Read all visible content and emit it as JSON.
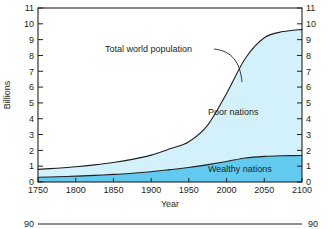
{
  "chart_data": {
    "type": "area",
    "stacked": true,
    "title": "",
    "xlabel": "Year",
    "ylabel": "Billions",
    "xlim": [
      1750,
      2100
    ],
    "ylim": [
      0,
      11
    ],
    "xticks": [
      1750,
      1800,
      1850,
      1900,
      1950,
      2000,
      2050,
      2100
    ],
    "yticks": [
      0,
      1,
      2,
      3,
      4,
      5,
      6,
      7,
      8,
      9,
      10,
      11
    ],
    "ytick_labels_left": [
      "0",
      "1",
      "2",
      "3",
      "4",
      "5",
      "6",
      "7",
      "8",
      "9",
      "10",
      "11"
    ],
    "ytick_labels_right": [
      "0",
      "1",
      "2",
      "3",
      "4",
      "5",
      "6",
      "7",
      "8",
      "9",
      "10",
      "11"
    ],
    "xtick_labels": [
      "1750",
      "1800",
      "1850",
      "1900",
      "1950",
      "2000",
      "2050",
      "2100"
    ],
    "grid": false,
    "legend_position": "inline-annotations",
    "x": [
      1750,
      1775,
      1800,
      1825,
      1850,
      1875,
      1900,
      1925,
      1950,
      1975,
      2000,
      2025,
      2050,
      2075,
      2100
    ],
    "series": [
      {
        "name": "Wealthy nations",
        "color": "#62c9ef",
        "values": [
          0.3,
          0.33,
          0.37,
          0.42,
          0.48,
          0.55,
          0.65,
          0.78,
          0.92,
          1.1,
          1.3,
          1.52,
          1.62,
          1.66,
          1.68
        ]
      },
      {
        "name": "Poor nations",
        "color": "#d2f1fb",
        "values": [
          0.5,
          0.54,
          0.59,
          0.66,
          0.75,
          0.88,
          1.05,
          1.32,
          1.63,
          2.5,
          4.3,
          6.3,
          7.5,
          7.85,
          7.97
        ]
      }
    ],
    "total_series": {
      "name": "Total world population",
      "values": [
        0.8,
        0.87,
        0.96,
        1.08,
        1.23,
        1.43,
        1.7,
        2.1,
        2.55,
        3.6,
        5.6,
        7.82,
        9.12,
        9.51,
        9.65
      ]
    },
    "annotations": [
      {
        "text": "Total world population",
        "target_x": 2005,
        "target_y": 6.1,
        "leader": true
      },
      {
        "text": "Poor nations",
        "x": 2040,
        "y": 4.6,
        "leader": false
      },
      {
        "text": "Wealthy nations",
        "x": 2040,
        "y": 0.65,
        "leader": false
      }
    ]
  },
  "axes": {
    "left": {
      "title": "Billions",
      "ticks": [
        "0",
        "1",
        "2",
        "3",
        "4",
        "5",
        "6",
        "7",
        "8",
        "9",
        "10",
        "11"
      ]
    },
    "right": {
      "ticks": [
        "0",
        "1",
        "2",
        "3",
        "4",
        "5",
        "6",
        "7",
        "8",
        "9",
        "10",
        "11"
      ]
    },
    "bottom": {
      "title": "Year",
      "ticks": [
        "1750",
        "1800",
        "1850",
        "1900",
        "1950",
        "2000",
        "2050",
        "2100"
      ]
    }
  },
  "labels": {
    "total": "Total world population",
    "poor": "Poor nations",
    "wealthy": "Wealthy nations"
  },
  "next_chart_fragment": {
    "left_tick": "90",
    "right_tick": "90"
  },
  "colors": {
    "poor_fill": "#d2f1fb",
    "wealthy_fill": "#62c9ef",
    "line": "#231f20",
    "background": "#ffffff"
  }
}
